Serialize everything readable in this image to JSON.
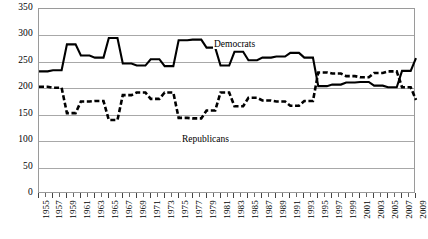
{
  "chart_data": {
    "type": "line",
    "title": "",
    "subtitle": "",
    "xlabel": "",
    "ylabel": "",
    "xlim": [
      1955,
      2009
    ],
    "ylim": [
      0,
      350
    ],
    "grid": true,
    "legend_position": "inline-annotations",
    "y_ticks": [
      0,
      50,
      100,
      150,
      200,
      250,
      300,
      350
    ],
    "y_tick_labels": [
      "0",
      "50",
      "100",
      "150",
      "200",
      "250",
      "300",
      "350"
    ],
    "x_tick_labels": [
      "1955",
      "1957",
      "1959",
      "1961",
      "1963",
      "1965",
      "1967",
      "1969",
      "1971",
      "1973",
      "1975",
      "1977",
      "1979",
      "1981",
      "1983",
      "1985",
      "1987",
      "1989",
      "1991",
      "1993",
      "1995",
      "1997",
      "1999",
      "2001",
      "2003",
      "2005",
      "2007",
      "2009"
    ],
    "x": [
      1955,
      1957,
      1959,
      1961,
      1963,
      1965,
      1967,
      1969,
      1971,
      1973,
      1975,
      1977,
      1979,
      1981,
      1983,
      1985,
      1987,
      1989,
      1991,
      1993,
      1995,
      1997,
      1999,
      2001,
      2003,
      2005,
      2007,
      2009
    ],
    "series": [
      {
        "name": "Democrats",
        "style": "solid",
        "color": "#000000",
        "values": [
          232,
          234,
          283,
          262,
          258,
          295,
          247,
          243,
          255,
          242,
          291,
          292,
          277,
          243,
          269,
          253,
          258,
          260,
          267,
          258,
          204,
          207,
          211,
          212,
          205,
          202,
          233,
          257
        ]
      },
      {
        "name": "Republicans",
        "style": "dashed",
        "color": "#000000",
        "values": [
          203,
          201,
          153,
          175,
          176,
          140,
          187,
          192,
          180,
          192,
          144,
          143,
          158,
          192,
          166,
          182,
          177,
          175,
          167,
          176,
          230,
          228,
          223,
          221,
          229,
          232,
          202,
          178
        ]
      }
    ],
    "annotations": [
      {
        "name": "democrats-label",
        "text": "Democrats"
      },
      {
        "name": "republicans-label",
        "text": "Republicans"
      }
    ]
  }
}
